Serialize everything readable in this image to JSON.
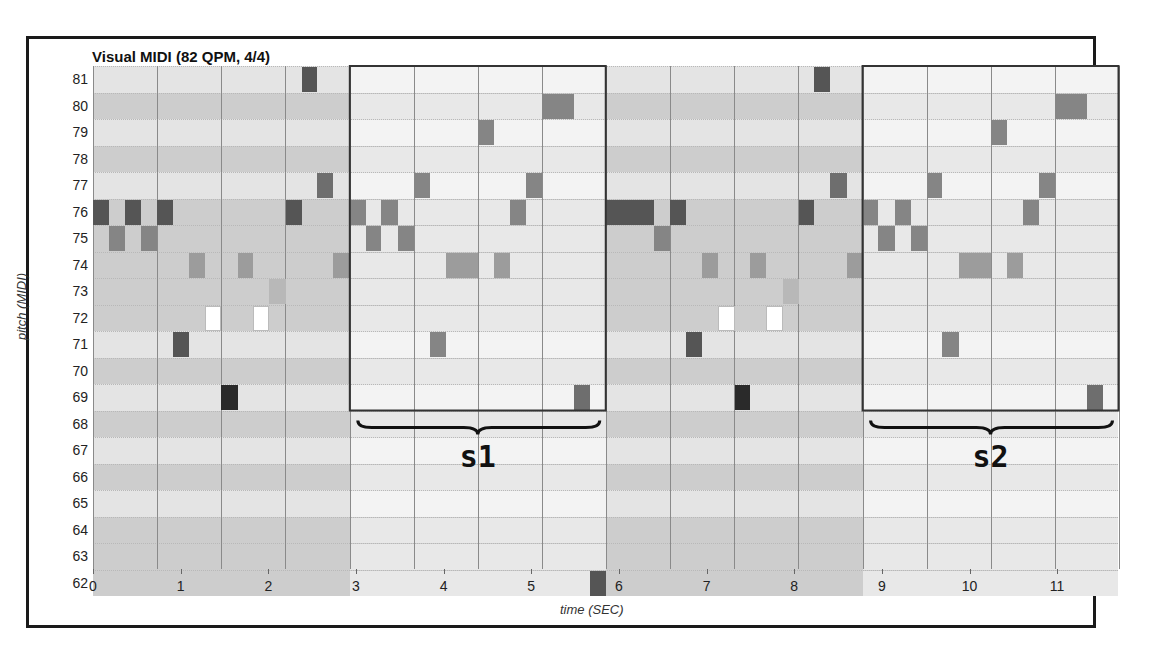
{
  "title": "Visual MIDI (82 QPM, 4/4)",
  "axes": {
    "ylabel": "pitch (MIDI)",
    "xlabel": "time (SEC)"
  },
  "segments": [
    {
      "label": "s1"
    },
    {
      "label": "s2"
    }
  ],
  "chart_data": {
    "type": "heatmap",
    "subtype": "piano-roll",
    "title": "Visual MIDI (82 QPM, 4/4)",
    "xlabel": "time (SEC)",
    "ylabel": "pitch (MIDI)",
    "tempo_qpm": 82,
    "time_signature": "4/4",
    "x_ticks": [
      0,
      1,
      2,
      3,
      4,
      5,
      6,
      7,
      8,
      9,
      10,
      11
    ],
    "y_ticks": [
      81,
      80,
      79,
      78,
      77,
      76,
      75,
      74,
      73,
      72,
      71,
      70,
      69,
      68,
      67,
      66,
      65,
      64,
      63,
      62
    ],
    "xlim": [
      0,
      11.7
    ],
    "ylim": [
      62,
      81
    ],
    "grid": true,
    "highlighted_segments": [
      {
        "label": "s1",
        "start_sec": 2.93,
        "end_sec": 5.85,
        "pitch_range": [
          69,
          81
        ]
      },
      {
        "label": "s2",
        "start_sec": 8.78,
        "end_sec": 11.7,
        "pitch_range": [
          69,
          81
        ]
      }
    ],
    "notes": [
      {
        "pitch": 76,
        "start": 0.0,
        "end": 0.18,
        "shade": "dark"
      },
      {
        "pitch": 75,
        "start": 0.18,
        "end": 0.37,
        "shade": "mid"
      },
      {
        "pitch": 76,
        "start": 0.37,
        "end": 0.55,
        "shade": "dark"
      },
      {
        "pitch": 75,
        "start": 0.55,
        "end": 0.73,
        "shade": "mid"
      },
      {
        "pitch": 76,
        "start": 0.73,
        "end": 0.91,
        "shade": "dark"
      },
      {
        "pitch": 71,
        "start": 0.91,
        "end": 1.1,
        "shade": "dark"
      },
      {
        "pitch": 74,
        "start": 1.1,
        "end": 1.28,
        "shade": "midlight"
      },
      {
        "pitch": 72,
        "start": 1.28,
        "end": 1.46,
        "shade": "white"
      },
      {
        "pitch": 69,
        "start": 1.46,
        "end": 1.65,
        "shade": "black"
      },
      {
        "pitch": 74,
        "start": 1.65,
        "end": 1.83,
        "shade": "midlight"
      },
      {
        "pitch": 72,
        "start": 1.83,
        "end": 2.01,
        "shade": "white"
      },
      {
        "pitch": 73,
        "start": 2.01,
        "end": 2.2,
        "shade": "light"
      },
      {
        "pitch": 76,
        "start": 2.2,
        "end": 2.38,
        "shade": "dark"
      },
      {
        "pitch": 81,
        "start": 2.38,
        "end": 2.56,
        "shade": "dark"
      },
      {
        "pitch": 77,
        "start": 2.56,
        "end": 2.74,
        "shade": "middark"
      },
      {
        "pitch": 74,
        "start": 2.74,
        "end": 2.93,
        "shade": "midlight"
      },
      {
        "pitch": 76,
        "start": 2.93,
        "end": 3.11,
        "shade": "mid"
      },
      {
        "pitch": 75,
        "start": 3.11,
        "end": 3.29,
        "shade": "mid"
      },
      {
        "pitch": 76,
        "start": 3.29,
        "end": 3.48,
        "shade": "mid"
      },
      {
        "pitch": 75,
        "start": 3.48,
        "end": 3.66,
        "shade": "mid"
      },
      {
        "pitch": 71,
        "start": 3.84,
        "end": 4.03,
        "shade": "mid"
      },
      {
        "pitch": 77,
        "start": 3.66,
        "end": 3.84,
        "shade": "mid"
      },
      {
        "pitch": 74,
        "start": 4.03,
        "end": 4.39,
        "shade": "midlight"
      },
      {
        "pitch": 79,
        "start": 4.39,
        "end": 4.57,
        "shade": "mid"
      },
      {
        "pitch": 74,
        "start": 4.57,
        "end": 4.76,
        "shade": "midlight"
      },
      {
        "pitch": 76,
        "start": 4.76,
        "end": 4.94,
        "shade": "mid"
      },
      {
        "pitch": 77,
        "start": 4.94,
        "end": 5.12,
        "shade": "mid"
      },
      {
        "pitch": 80,
        "start": 5.12,
        "end": 5.49,
        "shade": "mid"
      },
      {
        "pitch": 69,
        "start": 5.49,
        "end": 5.67,
        "shade": "middark"
      },
      {
        "pitch": 62,
        "start": 5.67,
        "end": 5.85,
        "shade": "dark"
      },
      {
        "pitch": 76,
        "start": 5.85,
        "end": 6.22,
        "shade": "dark"
      },
      {
        "pitch": 76,
        "start": 6.22,
        "end": 6.4,
        "shade": "dark"
      },
      {
        "pitch": 75,
        "start": 6.4,
        "end": 6.58,
        "shade": "mid"
      },
      {
        "pitch": 76,
        "start": 6.58,
        "end": 6.77,
        "shade": "dark"
      },
      {
        "pitch": 71,
        "start": 6.77,
        "end": 6.95,
        "shade": "dark"
      },
      {
        "pitch": 74,
        "start": 6.95,
        "end": 7.13,
        "shade": "midlight"
      },
      {
        "pitch": 72,
        "start": 7.13,
        "end": 7.32,
        "shade": "white"
      },
      {
        "pitch": 69,
        "start": 7.32,
        "end": 7.5,
        "shade": "black"
      },
      {
        "pitch": 74,
        "start": 7.5,
        "end": 7.68,
        "shade": "midlight"
      },
      {
        "pitch": 72,
        "start": 7.68,
        "end": 7.87,
        "shade": "white"
      },
      {
        "pitch": 73,
        "start": 7.87,
        "end": 8.05,
        "shade": "light"
      },
      {
        "pitch": 76,
        "start": 8.05,
        "end": 8.23,
        "shade": "dark"
      },
      {
        "pitch": 81,
        "start": 8.23,
        "end": 8.41,
        "shade": "dark"
      },
      {
        "pitch": 77,
        "start": 8.41,
        "end": 8.6,
        "shade": "middark"
      },
      {
        "pitch": 74,
        "start": 8.6,
        "end": 8.78,
        "shade": "midlight"
      },
      {
        "pitch": 76,
        "start": 8.78,
        "end": 8.96,
        "shade": "mid"
      },
      {
        "pitch": 75,
        "start": 8.96,
        "end": 9.15,
        "shade": "mid"
      },
      {
        "pitch": 76,
        "start": 9.15,
        "end": 9.33,
        "shade": "mid"
      },
      {
        "pitch": 75,
        "start": 9.33,
        "end": 9.51,
        "shade": "mid"
      },
      {
        "pitch": 77,
        "start": 9.51,
        "end": 9.69,
        "shade": "mid"
      },
      {
        "pitch": 71,
        "start": 9.69,
        "end": 9.88,
        "shade": "mid"
      },
      {
        "pitch": 74,
        "start": 9.88,
        "end": 10.24,
        "shade": "midlight"
      },
      {
        "pitch": 79,
        "start": 10.24,
        "end": 10.43,
        "shade": "mid"
      },
      {
        "pitch": 74,
        "start": 10.43,
        "end": 10.61,
        "shade": "midlight"
      },
      {
        "pitch": 76,
        "start": 10.61,
        "end": 10.79,
        "shade": "mid"
      },
      {
        "pitch": 77,
        "start": 10.79,
        "end": 10.98,
        "shade": "mid"
      },
      {
        "pitch": 80,
        "start": 10.98,
        "end": 11.34,
        "shade": "mid"
      },
      {
        "pitch": 69,
        "start": 11.34,
        "end": 11.52,
        "shade": "middark"
      }
    ]
  },
  "shade_colors": {
    "black": "#2a2a2a",
    "dark": "#555555",
    "middark": "#6e6e6e",
    "mid": "#858585",
    "midlight": "#9c9c9c",
    "light": "#b8b8b8",
    "white": "#ffffff"
  }
}
